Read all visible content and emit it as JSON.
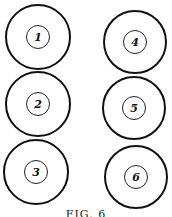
{
  "figure": {
    "caption": "FIG. 6",
    "stroke_color": "#111111",
    "background": "#ffffff"
  },
  "circles": [
    {
      "label": "1",
      "cx": 38,
      "cy": 37,
      "r": 33,
      "inner_r": 12
    },
    {
      "label": "2",
      "cx": 38,
      "cy": 104,
      "r": 33,
      "inner_r": 12
    },
    {
      "label": "3",
      "cx": 36,
      "cy": 172,
      "r": 33,
      "inner_r": 12
    },
    {
      "label": "4",
      "cx": 135,
      "cy": 42,
      "r": 32,
      "inner_r": 12
    },
    {
      "label": "5",
      "cx": 134,
      "cy": 108,
      "r": 32,
      "inner_r": 12
    },
    {
      "label": "6",
      "cx": 136,
      "cy": 177,
      "r": 32,
      "inner_r": 12
    }
  ]
}
